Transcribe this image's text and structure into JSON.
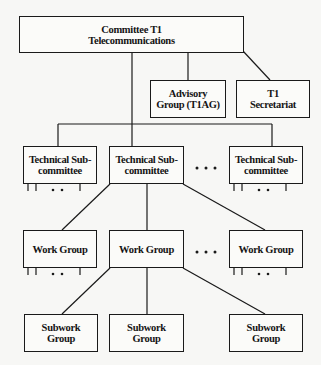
{
  "diagram": {
    "type": "org-chart",
    "root": {
      "label": "Committee T1\nTelecommunications"
    },
    "advisory": {
      "label": "Advisory\nGroup (T1AG)"
    },
    "secretariat": {
      "label": "T1\nSecretariat"
    },
    "technical_subcommittees": [
      {
        "label": "Technical Sub-\ncommittee"
      },
      {
        "label": "Technical Sub-\ncommittee"
      },
      {
        "label": "Technical Sub-\ncommittee"
      }
    ],
    "work_groups": [
      {
        "label": "Work Group"
      },
      {
        "label": "Work Group"
      },
      {
        "label": "Work Group"
      }
    ],
    "subwork_groups": [
      {
        "label": "Subwork\nGroup"
      },
      {
        "label": "Subwork\nGroup"
      },
      {
        "label": "Subwork\nGroup"
      }
    ],
    "ellipsis": ". . .",
    "small_ellipsis": ". .",
    "colors": {
      "line": "#1a1a1a",
      "background": "#f7f7f5"
    }
  }
}
